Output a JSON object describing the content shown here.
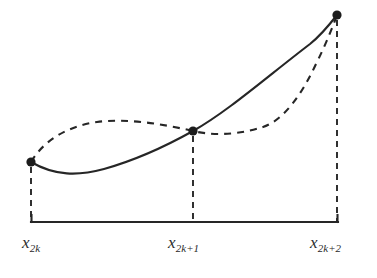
{
  "figure": {
    "background_color": "#ffffff",
    "ink_color": "#262626",
    "width": 377,
    "height": 278
  },
  "axis": {
    "name": "x-axis",
    "y": 222,
    "x_start": 31,
    "x_end": 338,
    "tick_height": 7,
    "stroke_width": 2.1,
    "color": "#262626"
  },
  "labels": [
    {
      "id": "x2k",
      "base": "x",
      "sub": "2k",
      "x": 22,
      "y": 234
    },
    {
      "id": "x2k1",
      "base": "x",
      "sub": "2k+1",
      "x": 168,
      "y": 234
    },
    {
      "id": "x2k2",
      "base": "x",
      "sub": "2k+2",
      "x": 310,
      "y": 234
    }
  ],
  "nodes": [
    {
      "id": "node-left",
      "label": "x_2k",
      "x": 31,
      "y": 162,
      "radius": 4.6
    },
    {
      "id": "node-middle",
      "label": "x_2k+1",
      "x": 193,
      "y": 131,
      "radius": 4.6
    },
    {
      "id": "node-right",
      "label": "x_2k+2",
      "x": 337,
      "y": 15,
      "radius": 4.6
    }
  ],
  "droplines": [
    {
      "id": "dropline-left",
      "x": 31,
      "y_top": 167,
      "y_bottom": 221
    },
    {
      "id": "dropline-middle",
      "x": 193,
      "y_top": 136,
      "y_bottom": 221
    },
    {
      "id": "dropline-right",
      "x": 337,
      "y_top": 20,
      "y_bottom": 221
    }
  ],
  "curves": [
    {
      "id": "solid-curve",
      "style": "solid",
      "role": "function f(x)",
      "stroke_width": 2.1,
      "path": "M 31 162 C 55 176, 78 176, 104 169 C 136 160, 168 145, 193 131 C 227 112, 268 76, 310 44 C 320 36, 330 24, 337 15"
    },
    {
      "id": "dashed-curve",
      "style": "dashed",
      "role": "interpolating parabola",
      "stroke_width": 2.1,
      "dash_pattern": "7 6",
      "path": "M 31 162 C 44 140, 68 126, 97 122 C 126 118, 163 124, 193 131 C 218 137, 244 133, 263 127 C 284 120, 302 94, 316 64 C 326 44, 333 26, 337 15"
    }
  ],
  "chart_data": {
    "type": "line",
    "xlabel": "",
    "ylabel": "",
    "grid": false,
    "legend": "none",
    "x": [
      "x_2k",
      "x_2k+1",
      "x_2k+2"
    ],
    "node_pixel_coords": [
      [
        31,
        162
      ],
      [
        193,
        131
      ],
      [
        337,
        15
      ]
    ],
    "series": [
      {
        "name": "f(x)",
        "linestyle": "solid",
        "description": "Actual function: dips slightly below the left node, reaches a minimum near the first third, then rises monotonically and steeply to the right node."
      },
      {
        "name": "interpolating parabola",
        "linestyle": "dashed",
        "description": "Parabola through the three nodes: arcs above the function between x_2k and x_2k+1, stays nearly flat just right of x_2k+1, then curves sharply upward to meet the function at x_2k+2."
      }
    ],
    "annotations": [
      "x_2k",
      "x_2k+1",
      "x_2k+2"
    ]
  }
}
